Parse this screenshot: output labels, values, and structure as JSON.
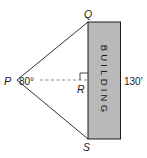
{
  "diagram": {
    "points": {
      "P": {
        "label": "P"
      },
      "Q": {
        "label": "Q"
      },
      "R": {
        "label": "R"
      },
      "S": {
        "label": "S"
      }
    },
    "angle_label": "80°",
    "height_label": "130'",
    "building_label": "BUILDING",
    "colors": {
      "building_fill": "#b9b9b9",
      "stroke": "#1a1a1a",
      "dashed": "#8a8a8a"
    }
  }
}
